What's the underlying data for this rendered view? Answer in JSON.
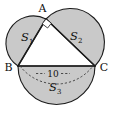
{
  "figure": {
    "type": "geometry-diagram",
    "background_color": "#ffffff",
    "fill_color": "#c9c9c9",
    "stroke_color": "#1c1c1c",
    "vertices": [
      {
        "name": "A",
        "label": "A",
        "x": 46,
        "y": 19
      },
      {
        "name": "B",
        "label": "B",
        "x": 18,
        "y": 66
      },
      {
        "name": "C",
        "label": "C",
        "x": 95,
        "y": 66
      }
    ],
    "vertex_labels": {
      "a": "A",
      "b": "B",
      "c": "C"
    },
    "regions": [
      {
        "name": "semicircle-on-ab",
        "base": "S",
        "subscript": "1",
        "label": "S",
        "sub": "1"
      },
      {
        "name": "semicircle-on-ac",
        "base": "S",
        "subscript": "2",
        "label": "S",
        "sub": "2"
      },
      {
        "name": "semicircle-on-bc",
        "base": "S",
        "subscript": "3",
        "label": "S",
        "sub": "3"
      }
    ],
    "dimension": {
      "name": "hypotenuse-length",
      "value": "10",
      "side": "BC"
    },
    "right_angle": {
      "at": "A",
      "marker": "square"
    }
  }
}
